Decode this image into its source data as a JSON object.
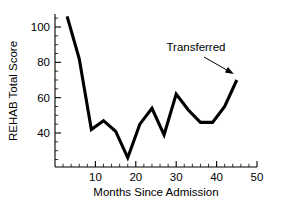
{
  "chart_data": {
    "type": "line",
    "title": "",
    "xlabel": "Months Since Admission",
    "ylabel": "REHAB Total Score",
    "xlim": [
      0,
      50
    ],
    "ylim": [
      24,
      110
    ],
    "grid": false,
    "legend": null,
    "x": [
      3,
      6,
      9,
      12,
      15,
      18,
      21,
      24,
      27,
      30,
      33,
      36,
      39,
      42,
      45
    ],
    "values": [
      106,
      82,
      42,
      47,
      41,
      26,
      45,
      54,
      39,
      62,
      53,
      46,
      46,
      55,
      70
    ],
    "series": [
      {
        "name": "REHAB Total Score",
        "values": [
          106,
          82,
          42,
          47,
          41,
          26,
          45,
          54,
          39,
          62,
          53,
          46,
          46,
          55,
          70
        ]
      }
    ],
    "xticks": [
      10,
      20,
      30,
      40,
      50
    ],
    "xticklabels": [
      "10",
      "20",
      "30",
      "40",
      "50"
    ],
    "xtick_minor_step": 2,
    "yticks": [
      40,
      60,
      80,
      100
    ],
    "yticklabels": [
      "40",
      "60",
      "80",
      "100"
    ],
    "ytick_minor_step": 5,
    "annotations": [
      {
        "text": "Transferred",
        "points_to_x": 45,
        "points_to_y": 70
      }
    ],
    "line_color": "#000000"
  },
  "axes": {
    "x_title": "Months Since Admission",
    "y_title": "REHAB Total Score"
  },
  "ticklabels": {
    "x": [
      "10",
      "20",
      "30",
      "40",
      "50"
    ],
    "y": [
      "40",
      "60",
      "80",
      "100"
    ]
  },
  "annotation": {
    "label": "Transferred"
  }
}
